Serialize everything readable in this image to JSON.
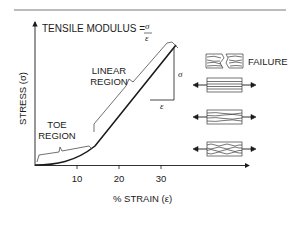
{
  "diagram": {
    "title_formula": {
      "label": "TENSILE MODULUS =",
      "numerator": "σ",
      "denominator": "ε"
    },
    "y_axis_label": "STRESS (σ)",
    "x_axis_label": "% STRAIN (ε)",
    "x_ticks": [
      "10",
      "20",
      "30"
    ],
    "regions": [
      {
        "name": "toe",
        "line1": "TOE",
        "line2": "REGION"
      },
      {
        "name": "linear",
        "line1": "LINEAR",
        "line2": "REGION"
      }
    ],
    "slope_triangle": {
      "vertical_label": "σ",
      "horizontal_label": "ε"
    },
    "failure_label": "FAILURE",
    "specimens": [
      {
        "state": "failure",
        "description": "fractured fibers"
      },
      {
        "state": "linear",
        "description": "straightened fibers under tension"
      },
      {
        "state": "partially-straightened",
        "description": "slightly wavy fibers under tension"
      },
      {
        "state": "crimped",
        "description": "wavy/crimped fibers under tension"
      }
    ],
    "colors": {
      "line": "#1a1a1a",
      "background": "#ffffff"
    }
  }
}
